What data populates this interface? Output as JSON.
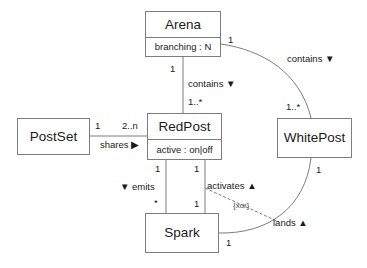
{
  "diagram": {
    "stroke_color": "#7d7d7d",
    "text_color": "#1a1a1a",
    "background": "#ffffff"
  },
  "classes": {
    "arena": {
      "name": "Arena",
      "attribute": "branching : N"
    },
    "redpost": {
      "name": "RedPost",
      "attribute": "active : on|off"
    },
    "postset": {
      "name": "PostSet"
    },
    "whitepost": {
      "name": "WhitePost"
    },
    "spark": {
      "name": "Spark"
    }
  },
  "associations": {
    "arena_contains_redpost": {
      "label": "contains ▼",
      "source_multiplicity": "1",
      "target_multiplicity": "1..*"
    },
    "arena_contains_whitepost": {
      "label": "contains ▼",
      "source_multiplicity": "1",
      "target_multiplicity": "1..*"
    },
    "postset_shares_redpost": {
      "label": "shares ▶",
      "source_multiplicity": "1",
      "target_multiplicity": "2..n"
    },
    "redpost_emits_spark": {
      "label": "▼ emits",
      "source_multiplicity": "1",
      "target_multiplicity": "*"
    },
    "spark_activates_redpost": {
      "label": "activates ▲",
      "source_multiplicity": "1",
      "target_multiplicity": "1"
    },
    "spark_lands_whitepost": {
      "label": "lands ▲",
      "source_multiplicity": "1",
      "target_multiplicity": "1"
    },
    "xor_constraint": {
      "label": "{xor}"
    }
  }
}
